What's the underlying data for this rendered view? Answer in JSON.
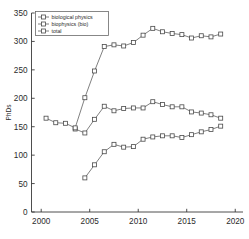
{
  "chart_data": {
    "type": "line",
    "title": "",
    "xlabel": "",
    "ylabel": "PhDs",
    "xlim": [
      1999,
      2020.8
    ],
    "ylim": [
      0,
      350
    ],
    "xticks": [
      2000,
      2005,
      2010,
      2015,
      2020
    ],
    "yticks": [
      0,
      50,
      100,
      150,
      200,
      250,
      300,
      350
    ],
    "grid": false,
    "legend_position": "top-left",
    "marker": "square",
    "series": [
      {
        "name": "biological physics",
        "x": [
          2004.5,
          2005.5,
          2006.5,
          2007.5,
          2008.5,
          2009.5,
          2010.5,
          2011.5,
          2012.5,
          2013.5,
          2014.5,
          2015.5,
          2016.5,
          2017.5,
          2018.5
        ],
        "values": [
          60,
          83,
          106,
          119,
          114,
          115,
          128,
          132,
          134,
          134,
          131,
          136,
          141,
          145,
          151
        ]
      },
      {
        "name": "biophysics (bio)",
        "x": [
          2003.5,
          2004.5,
          2005.5,
          2006.5,
          2007.5,
          2008.5,
          2009.5,
          2010.5,
          2011.5,
          2012.5,
          2013.5,
          2014.5,
          2015.5,
          2016.5,
          2017.5,
          2018.5
        ],
        "values": [
          146,
          139,
          163,
          186,
          178,
          182,
          183,
          183,
          194,
          189,
          185,
          185,
          176,
          174,
          171,
          165
        ]
      },
      {
        "name": "total",
        "x": [
          2000.5,
          2001.5,
          2002.5,
          2003.5,
          2004.5,
          2005.5,
          2006.5,
          2007.5,
          2008.5,
          2009.5,
          2010.5,
          2011.5,
          2012.5,
          2013.5,
          2014.5,
          2015.5,
          2016.5,
          2017.5,
          2018.5
        ],
        "values": [
          165,
          157,
          156,
          148,
          201,
          248,
          291,
          294,
          292,
          298,
          311,
          323,
          317,
          314,
          312,
          306,
          310,
          308,
          313
        ]
      }
    ],
    "legend": [
      "biological physics",
      "biophysics (bio)",
      "total"
    ],
    "colors": {
      "line": "#555555",
      "marker_edge": "#4a4a4a",
      "marker_face": "#ffffff",
      "axis": "#3a3a3a",
      "text": "#2b2b2b"
    }
  }
}
